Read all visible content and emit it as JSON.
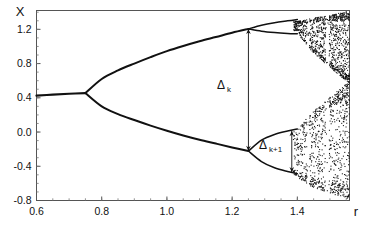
{
  "chart_data": {
    "type": "scatter",
    "title": "",
    "subtitle": "",
    "xlabel": "r",
    "ylabel": "X",
    "xlim": [
      0.6,
      1.56
    ],
    "ylim": [
      -0.8,
      1.42
    ],
    "grid": false,
    "legend": null,
    "xticks": [
      0.6,
      0.8,
      1.0,
      1.2,
      1.4
    ],
    "xtick_labels": [
      "0.6",
      "0.8",
      "1.0",
      "1.2",
      "1.4"
    ],
    "yticks": [
      -0.8,
      -0.4,
      0.0,
      0.4,
      0.8,
      1.2
    ],
    "ytick_labels": [
      "-0.8",
      "-0.4",
      "0.0",
      "0.4",
      "0.8",
      "1.2"
    ],
    "minor_ytick_step": 0.1,
    "first_bifurcation_r": 0.75,
    "first_bifurcation_x": 0.45,
    "second_bifurcation_r": 1.25,
    "chaos_onset_r": 1.4,
    "branches": [
      {
        "name": "fixed-point",
        "r_range": [
          0.6,
          0.75
        ],
        "points": [
          [
            0.6,
            0.425
          ],
          [
            0.65,
            0.437
          ],
          [
            0.7,
            0.447
          ],
          [
            0.75,
            0.455
          ]
        ]
      },
      {
        "name": "period-2-upper",
        "r_range": [
          0.75,
          1.25
        ],
        "points": [
          [
            0.75,
            0.455
          ],
          [
            0.8,
            0.62
          ],
          [
            0.85,
            0.72
          ],
          [
            0.9,
            0.8
          ],
          [
            0.95,
            0.875
          ],
          [
            1.0,
            0.945
          ],
          [
            1.05,
            1.005
          ],
          [
            1.1,
            1.06
          ],
          [
            1.15,
            1.11
          ],
          [
            1.2,
            1.16
          ],
          [
            1.25,
            1.205
          ]
        ]
      },
      {
        "name": "period-2-lower",
        "r_range": [
          0.75,
          1.25
        ],
        "points": [
          [
            0.75,
            0.455
          ],
          [
            0.8,
            0.3
          ],
          [
            0.85,
            0.21
          ],
          [
            0.9,
            0.14
          ],
          [
            0.95,
            0.075
          ],
          [
            1.0,
            0.015
          ],
          [
            1.05,
            -0.04
          ],
          [
            1.1,
            -0.09
          ],
          [
            1.15,
            -0.135
          ],
          [
            1.2,
            -0.18
          ],
          [
            1.25,
            -0.222
          ]
        ]
      },
      {
        "name": "period-4-upper-a",
        "r_range": [
          1.25,
          1.4
        ],
        "points": [
          [
            1.25,
            1.205
          ],
          [
            1.29,
            1.248
          ],
          [
            1.33,
            1.278
          ],
          [
            1.37,
            1.3
          ],
          [
            1.4,
            1.315
          ]
        ]
      },
      {
        "name": "period-4-upper-b",
        "r_range": [
          1.25,
          1.4
        ],
        "points": [
          [
            1.25,
            1.205
          ],
          [
            1.29,
            1.178
          ],
          [
            1.33,
            1.162
          ],
          [
            1.37,
            1.152
          ],
          [
            1.4,
            1.148
          ]
        ]
      },
      {
        "name": "period-4-lower-a",
        "r_range": [
          1.25,
          1.4
        ],
        "points": [
          [
            1.25,
            -0.222
          ],
          [
            1.29,
            -0.095
          ],
          [
            1.33,
            -0.028
          ],
          [
            1.37,
            0.012
          ],
          [
            1.4,
            0.035
          ]
        ]
      },
      {
        "name": "period-4-lower-b",
        "r_range": [
          1.25,
          1.4
        ],
        "points": [
          [
            1.25,
            -0.222
          ],
          [
            1.29,
            -0.345
          ],
          [
            1.33,
            -0.418
          ],
          [
            1.37,
            -0.462
          ],
          [
            1.4,
            -0.487
          ]
        ]
      }
    ],
    "chaotic_bands": [
      {
        "name": "upper-band",
        "r_range": [
          1.4,
          1.56
        ],
        "x_range": [
          1.1,
          1.4
        ]
      },
      {
        "name": "lower-band",
        "r_range": [
          1.4,
          1.56
        ],
        "x_range": [
          -0.6,
          0.1
        ]
      },
      {
        "name": "merged-band",
        "r_range": [
          1.47,
          1.56
        ],
        "x_range": [
          -0.75,
          1.42
        ]
      }
    ],
    "annotations": [
      {
        "name": "delta-k",
        "label": "Δ",
        "subscript": "k",
        "r": 1.25,
        "x_top": 1.205,
        "x_bottom": -0.222,
        "arrow": "double",
        "label_r": 1.175,
        "label_x": 0.5
      },
      {
        "name": "delta-k-plus-1",
        "label": "Δ",
        "subscript": "k+1",
        "r": 1.383,
        "x_top": 0.012,
        "x_bottom": -0.47,
        "arrow": "double",
        "label_r": 1.318,
        "label_x": -0.2
      }
    ]
  },
  "axes": {
    "y_axis_label": "X",
    "x_axis_label": "r",
    "x_tick_labels": [
      "0.6",
      "0.8",
      "1.0",
      "1.2",
      "1.4"
    ],
    "y_tick_labels": [
      "1.2",
      "0.8",
      "0.4",
      "0.0",
      "-0.4",
      "-0.8"
    ]
  },
  "annotations": {
    "delta_k": {
      "symbol": "Δ",
      "subscript": "k"
    },
    "delta_k_plus_1": {
      "symbol": "Δ",
      "subscript": "k+1"
    }
  },
  "colors": {
    "background": "#ffffff",
    "ink": "#111111",
    "frame": "#555555",
    "tick": "#555555"
  }
}
